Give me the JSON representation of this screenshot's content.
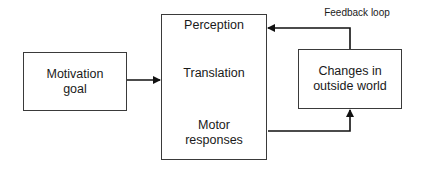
{
  "diagram": {
    "nodes": {
      "motivation": {
        "line1": "Motivation",
        "line2": "goal"
      },
      "process": {
        "perception": "Perception",
        "translation": "Translation",
        "motor_line1": "Motor",
        "motor_line2": "responses"
      },
      "changes": {
        "line1": "Changes in",
        "line2": "outside world"
      }
    },
    "edges": [
      {
        "from": "motivation",
        "to": "process"
      },
      {
        "from": "process.motor_responses",
        "to": "changes"
      },
      {
        "from": "changes",
        "to": "process.perception",
        "label": "Feedback loop"
      }
    ],
    "feedback_label": "Feedback loop"
  }
}
